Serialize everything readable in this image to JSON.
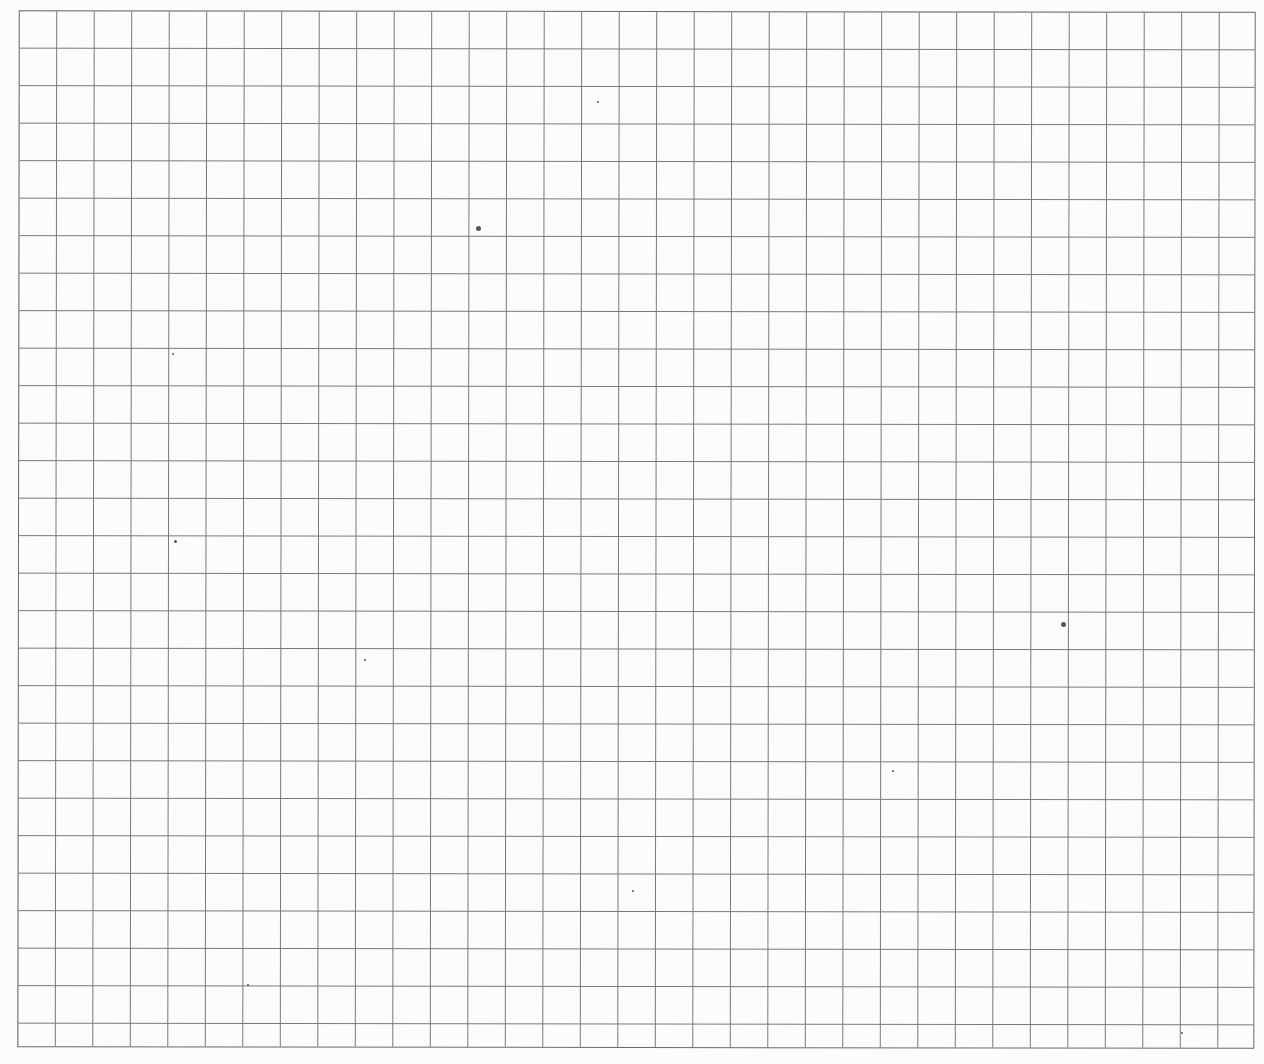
{
  "sheet": {
    "type": "graph-paper",
    "grid": {
      "columns": 33,
      "rows": 28,
      "cell_size_px": 37.5,
      "line_color": "#777777"
    },
    "background_color": "#fcfcfc",
    "specks": [
      {
        "x": 478,
        "y": 228,
        "r": 2.5
      },
      {
        "x": 1063,
        "y": 624,
        "r": 2.5
      },
      {
        "x": 175,
        "y": 541,
        "r": 1.5
      },
      {
        "x": 173,
        "y": 354,
        "r": 1.2
      },
      {
        "x": 1182,
        "y": 1033,
        "r": 1.2
      },
      {
        "x": 598,
        "y": 102,
        "r": 1
      },
      {
        "x": 365,
        "y": 660,
        "r": 1
      },
      {
        "x": 893,
        "y": 771,
        "r": 1
      },
      {
        "x": 633,
        "y": 891,
        "r": 1
      },
      {
        "x": 248,
        "y": 985,
        "r": 1
      }
    ]
  }
}
